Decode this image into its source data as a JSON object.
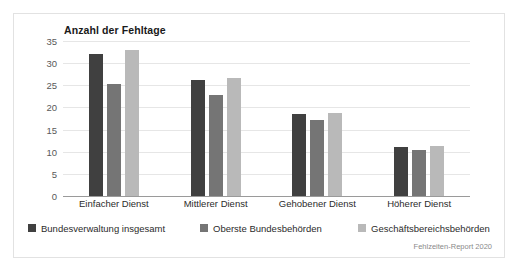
{
  "figure": {
    "title": "Anzahl der Fehltage",
    "source_note": "Fehlzeiten-Report 2020",
    "border_color": "#e2e2e2",
    "background": "#ffffff"
  },
  "legend": {
    "position": "bottom-left",
    "items": [
      {
        "label": "Bundesverwaltung insgesamt",
        "color": "#404040"
      },
      {
        "label": "Oberste Bundesbehörden",
        "color": "#757575"
      },
      {
        "label": "Geschäftsbereichsbehörden",
        "color": "#b9b9b9"
      }
    ]
  },
  "chart_data": {
    "type": "bar",
    "title": "Anzahl der Fehltage",
    "xlabel": "",
    "ylabel": "Anzahl der Fehltage",
    "ylim": [
      0,
      35
    ],
    "ytick_step": 5,
    "yticks": [
      "0",
      "5",
      "10",
      "15",
      "20",
      "25",
      "30",
      "35"
    ],
    "grid": true,
    "grid_axis": "y",
    "legend_position": "bottom-left",
    "annotation": "Fehlzeiten-Report 2020",
    "categories": [
      "Einfacher Dienst",
      "Mittlerer Dienst",
      "Gehobener Dienst",
      "Höherer Dienst"
    ],
    "series": [
      {
        "name": "Bundesverwaltung insgesamt",
        "color": "#404040",
        "values": [
          32.1,
          26.3,
          18.6,
          11.1
        ]
      },
      {
        "name": "Oberste Bundesbehörden",
        "color": "#757575",
        "values": [
          25.3,
          22.8,
          17.2,
          10.4
        ]
      },
      {
        "name": "Geschäftsbereichsbehörden",
        "color": "#b9b9b9",
        "values": [
          33.0,
          26.6,
          18.8,
          11.2
        ]
      }
    ]
  }
}
